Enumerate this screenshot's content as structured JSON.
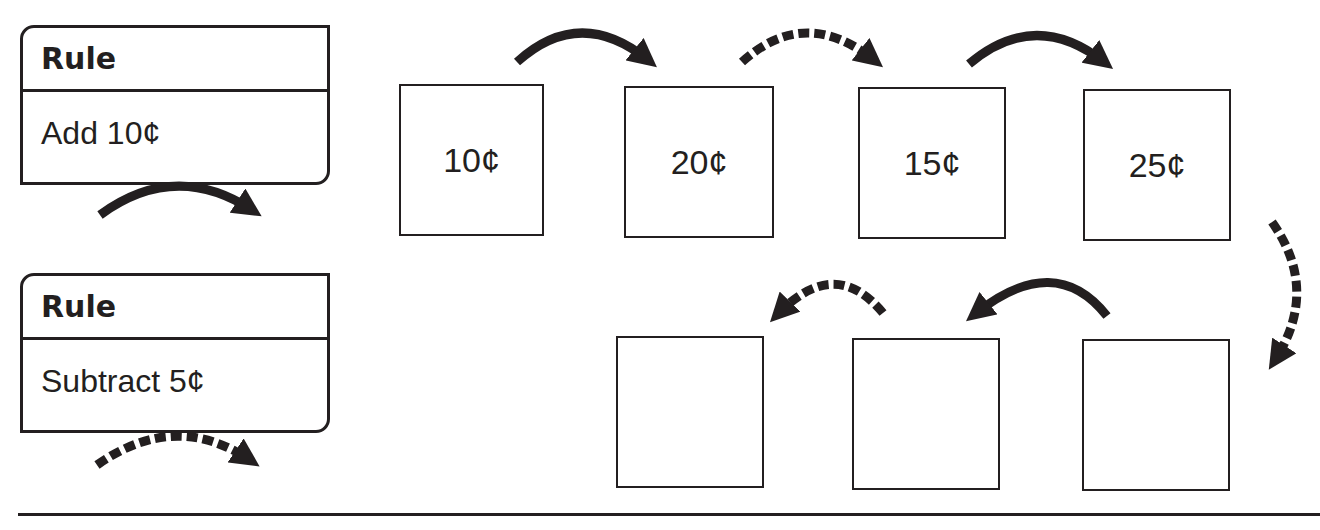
{
  "rules": [
    {
      "title": "Rule",
      "text": "Add 10¢",
      "arrow_style": "solid"
    },
    {
      "title": "Rule",
      "text": "Subtract 5¢",
      "arrow_style": "dashed"
    }
  ],
  "sequence": {
    "top_row": [
      "10¢",
      "20¢",
      "15¢",
      "25¢"
    ],
    "bottom_row_right_to_left": [
      "",
      "",
      ""
    ],
    "arrows": [
      "solid",
      "dashed",
      "solid",
      "dashed",
      "solid",
      "dashed"
    ]
  },
  "colors": {
    "ink": "#231f20",
    "background": "#ffffff"
  }
}
